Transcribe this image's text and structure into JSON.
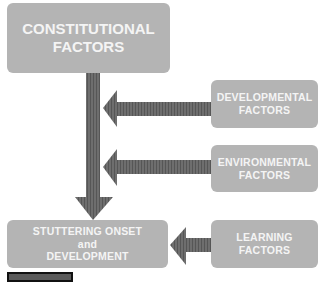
{
  "diagram": {
    "nodes": [
      {
        "id": "constitutional",
        "lines": [
          "CONSTITUTIONAL",
          "FACTORS"
        ]
      },
      {
        "id": "developmental",
        "lines": [
          "DEVELOPMENTAL",
          "FACTORS"
        ]
      },
      {
        "id": "environmental",
        "lines": [
          "ENVIRONMENTAL",
          "FACTORS"
        ]
      },
      {
        "id": "stuttering",
        "lines": [
          "STUTTERING ONSET",
          "and",
          "DEVELOPMENT"
        ]
      },
      {
        "id": "learning",
        "lines": [
          "LEARNING",
          "FACTORS"
        ]
      }
    ],
    "edges": [
      {
        "from": "constitutional",
        "to": "stuttering"
      },
      {
        "from": "developmental",
        "to": "constitutional-stuttering-arrow"
      },
      {
        "from": "environmental",
        "to": "constitutional-stuttering-arrow"
      },
      {
        "from": "learning",
        "to": "stuttering"
      }
    ],
    "colors": {
      "box": "#b4b4b4",
      "box_text": "#f4f4f4",
      "arrow": "#6a6a6a"
    }
  }
}
